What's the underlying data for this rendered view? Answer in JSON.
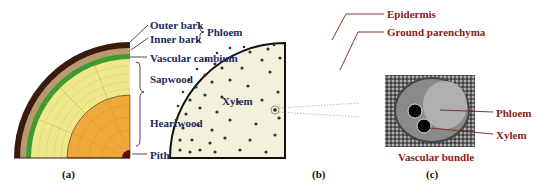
{
  "panel_a": {
    "caption": "(a)",
    "labels": {
      "outer_bark": "Outer bark",
      "inner_bark": "Inner bark",
      "phloem": "Phloem",
      "vascular_cambium": "Vascular cambium",
      "sapwood": "Sapwood",
      "heartwood": "Heartwood",
      "xylem": "Xylem",
      "pith": "Pith"
    },
    "colors": {
      "outer_bark": "#3b1a0e",
      "inner_bark": "#b79b6f",
      "cambium": "#3f9b2f",
      "sapwood": "#efe98c",
      "heartwood": "#efa93a",
      "pith": "#5a0d05"
    }
  },
  "panel_b": {
    "caption": "(b)",
    "labels": {
      "epidermis": "Epidermis",
      "ground_parenchyma": "Ground parenchyma"
    },
    "colors": {
      "fill": "#f3f1dc",
      "bundle": "#333333"
    }
  },
  "panel_c": {
    "caption": "(c)",
    "labels": {
      "phloem": "Phloem",
      "xylem": "Xylem",
      "vascular_bundle": "Vascular bundle"
    }
  }
}
